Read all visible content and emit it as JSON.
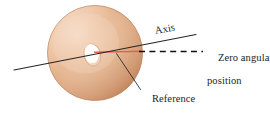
{
  "figure": {
    "background_color": "#ffffff",
    "width": 270,
    "height": 116
  },
  "labels": {
    "axis": "Axis",
    "zero_angular_position_line1": "Zero angular",
    "zero_angular_position_line2": "position",
    "reference_line_line1": "Reference",
    "reference_line_line2": "line"
  },
  "colors": {
    "disk_light": "#f3d3b8",
    "disk_mid": "#e4b48f",
    "disk_dark": "#c98c61",
    "disk_edge": "#b97c52",
    "hole_fill": "#fdf7f1",
    "reference_line": "#e8604c",
    "axis_line": "#1a1a1a",
    "dashed_line": "#000000",
    "text": "#231f20"
  },
  "geometry": {
    "disk_center_x": 95,
    "disk_center_y": 53,
    "disk_radius_x": 48,
    "disk_radius_y": 48,
    "disk_tilt_deg": -10.5,
    "hole_center_x": 92,
    "hole_center_y": 55,
    "hole_radius_x": 8,
    "hole_radius_y": 11,
    "axis_start_x": 14,
    "axis_start_y": 70,
    "axis_end_x": 196,
    "axis_end_y": 35,
    "reference_start_x": 95,
    "reference_start_y": 52,
    "reference_end_x": 141,
    "reference_end_y": 52,
    "dashed_start_x": 140,
    "dashed_start_y": 52,
    "dashed_end_x": 203,
    "dashed_end_y": 52,
    "leader_start_x": 117,
    "leader_start_y": 54,
    "leader_end_x": 141,
    "leader_end_y": 90
  }
}
